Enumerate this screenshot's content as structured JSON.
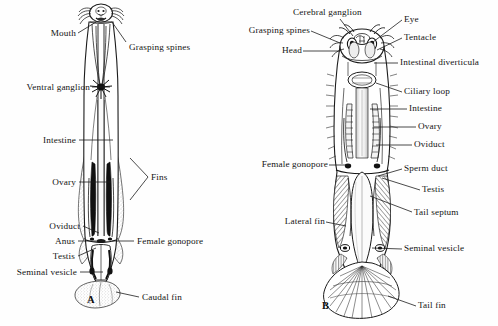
{
  "figure": {
    "type": "scientific-illustration",
    "panels": [
      {
        "id": "A",
        "letter": "A",
        "view": "ventral dissection",
        "labels": [
          {
            "text": "Mouth",
            "side": "left",
            "x": 44,
            "y": 28,
            "lead": [
              [
                78,
                33
              ],
              [
                96,
                22
              ]
            ]
          },
          {
            "text": "Ventral ganglion",
            "side": "left",
            "x": 8,
            "y": 82,
            "lead": [
              [
                92,
                87
              ],
              [
                110,
                87
              ]
            ]
          },
          {
            "text": "Intestine",
            "side": "left",
            "x": 38,
            "y": 135,
            "lead": [
              [
                79,
                140
              ],
              [
                113,
                140
              ]
            ]
          },
          {
            "text": "Ovary",
            "side": "left",
            "x": 48,
            "y": 177,
            "lead": [
              [
                79,
                182
              ],
              [
                111,
                182
              ]
            ]
          },
          {
            "text": "Oviduct",
            "side": "left",
            "x": 45,
            "y": 221,
            "lead": [
              [
                83,
                226
              ],
              [
                100,
                233
              ]
            ]
          },
          {
            "text": "Anus",
            "side": "left",
            "x": 53,
            "y": 236,
            "lead": [
              [
                78,
                241
              ],
              [
                106,
                241
              ]
            ]
          },
          {
            "text": "Testis",
            "side": "left",
            "x": 50,
            "y": 252,
            "lead": [
              [
                78,
                256
              ],
              [
                96,
                248
              ]
            ]
          },
          {
            "text": "Seminal vesicle",
            "side": "left",
            "x": 10,
            "y": 267,
            "lead": [
              [
                80,
                272
              ],
              [
                103,
                272
              ]
            ]
          },
          {
            "text": "Grasping spines",
            "side": "right",
            "x": 128,
            "y": 43,
            "lead": [
              [
                126,
                42
              ],
              [
                112,
                22
              ]
            ]
          },
          {
            "text": "Fins",
            "side": "right",
            "x": 151,
            "y": 172,
            "lead": [
              [
                148,
                177
              ],
              [
                130,
                158
              ]
            ]
          },
          {
            "text": "Female gonopore",
            "side": "right",
            "x": 136,
            "y": 236,
            "lead": [
              [
                134,
                241
              ],
              [
                112,
                241
              ]
            ]
          },
          {
            "text": "Caudal fin",
            "side": "right",
            "x": 141,
            "y": 293,
            "lead": [
              [
                139,
                297
              ],
              [
                116,
                292
              ]
            ]
          }
        ],
        "letter_pos": {
          "x": 87,
          "y": 294
        }
      },
      {
        "id": "B",
        "letter": "B",
        "view": "dorsal whole animal",
        "labels": [
          {
            "text": "Cerebral ganglion",
            "side": "top",
            "x": 295,
            "y": 8,
            "lead": [
              [
                340,
                19
              ],
              [
                352,
                40
              ]
            ]
          },
          {
            "text": "Grasping spines",
            "side": "left",
            "x": 240,
            "y": 26,
            "lead": [
              [
                311,
                31
              ],
              [
                338,
                47
              ]
            ]
          },
          {
            "text": "Head",
            "side": "left",
            "x": 276,
            "y": 46,
            "lead": [
              [
                303,
                51
              ],
              [
                340,
                51
              ]
            ]
          },
          {
            "text": "Female gonopore",
            "side": "left",
            "x": 257,
            "y": 160,
            "lead": [
              [
                329,
                165
              ],
              [
                352,
                165
              ]
            ]
          },
          {
            "text": "Lateral fin",
            "side": "left",
            "x": 280,
            "y": 217,
            "lead": [
              [
                326,
                222
              ],
              [
                346,
                226
              ]
            ]
          },
          {
            "text": "Eye",
            "side": "right",
            "x": 404,
            "y": 15,
            "lead": [
              [
                402,
                20
              ],
              [
                372,
                44
              ]
            ]
          },
          {
            "text": "Tentacle",
            "side": "right",
            "x": 404,
            "y": 33,
            "lead": [
              [
                402,
                38
              ],
              [
                374,
                53
              ]
            ]
          },
          {
            "text": "Intestinal diverticula",
            "side": "right",
            "x": 400,
            "y": 58,
            "lead": [
              [
                398,
                63
              ],
              [
                372,
                63
              ]
            ]
          },
          {
            "text": "Ciliary loop",
            "side": "right",
            "x": 404,
            "y": 87,
            "lead": [
              [
                402,
                92
              ],
              [
                375,
                82
              ]
            ]
          },
          {
            "text": "Intestine",
            "side": "right",
            "x": 409,
            "y": 104,
            "lead": [
              [
                407,
                109
              ],
              [
                368,
                109
              ]
            ]
          },
          {
            "text": "Ovary",
            "side": "right",
            "x": 418,
            "y": 122,
            "lead": [
              [
                416,
                127
              ],
              [
                372,
                127
              ]
            ]
          },
          {
            "text": "Oviduct",
            "side": "right",
            "x": 414,
            "y": 140,
            "lead": [
              [
                412,
                145
              ],
              [
                372,
                145
              ]
            ]
          },
          {
            "text": "Sperm duct",
            "side": "right",
            "x": 404,
            "y": 164,
            "lead": [
              [
                402,
                169
              ],
              [
                374,
                174
              ]
            ]
          },
          {
            "text": "Testis",
            "side": "right",
            "x": 422,
            "y": 185,
            "lead": [
              [
                420,
                190
              ],
              [
                378,
                177
              ]
            ]
          },
          {
            "text": "Tail septum",
            "side": "right",
            "x": 414,
            "y": 208,
            "lead": [
              [
                412,
                212
              ],
              [
                368,
                196
              ]
            ]
          },
          {
            "text": "Seminal vesicle",
            "side": "right",
            "x": 404,
            "y": 244,
            "lead": [
              [
                402,
                249
              ],
              [
                368,
                248
              ]
            ]
          },
          {
            "text": "Tail fin",
            "side": "right",
            "x": 418,
            "y": 301,
            "lead": [
              [
                416,
                306
              ],
              [
                386,
                295
              ]
            ]
          }
        ],
        "letter_pos": {
          "x": 322,
          "y": 300
        }
      }
    ]
  },
  "style": {
    "ink": "#1d1d1d",
    "paper": "#fefefe",
    "stipple": "#8d8d8d",
    "hatch": "#4a4a4a"
  }
}
